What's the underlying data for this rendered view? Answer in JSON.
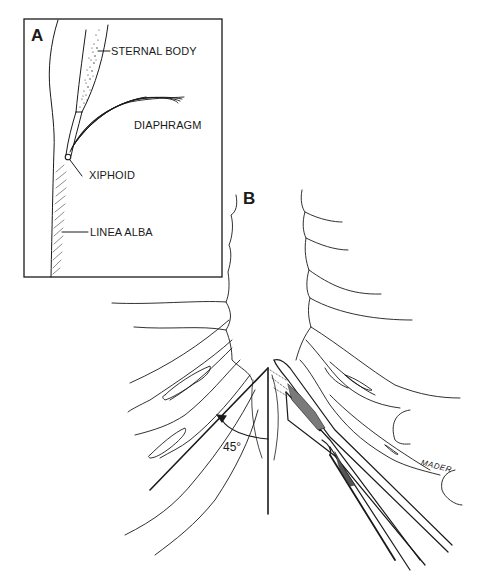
{
  "panels": {
    "a": {
      "letter": "A",
      "labels": {
        "sternal_body": "STERNAL BODY",
        "diaphragm": "DIAPHRAGM",
        "xiphoid": "XIPHOID",
        "linea_alba": "LINEA ALBA"
      }
    },
    "b": {
      "letter": "B",
      "angle_label": "45°",
      "signature": "MADER"
    }
  },
  "colors": {
    "ink": "#1a1a1a",
    "background": "#ffffff"
  }
}
